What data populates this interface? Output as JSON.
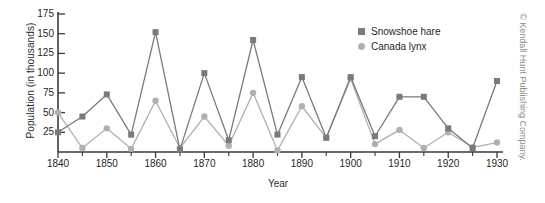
{
  "chart_data": {
    "type": "line",
    "title": "",
    "xlabel": "Year",
    "ylabel": "Population (in thousands)",
    "xlim": [
      1840,
      1930
    ],
    "ylim": [
      0,
      175
    ],
    "grid": false,
    "legend_position": "upper-right-inside",
    "x": [
      1840,
      1845,
      1850,
      1855,
      1860,
      1865,
      1870,
      1875,
      1880,
      1885,
      1890,
      1895,
      1900,
      1905,
      1910,
      1915,
      1920,
      1925,
      1930
    ],
    "xticks": [
      1840,
      1850,
      1860,
      1870,
      1880,
      1890,
      1900,
      1910,
      1920,
      1930
    ],
    "xtick_labels": [
      "1840",
      "1850",
      "1860",
      "1870",
      "1880",
      "1890",
      "1900",
      "1910",
      "1920",
      "1930"
    ],
    "xminor_ticks": [
      1845,
      1855,
      1865,
      1875,
      1885,
      1895,
      1905,
      1915,
      1925
    ],
    "yticks": [
      25,
      50,
      75,
      100,
      125,
      150,
      175
    ],
    "ytick_labels": [
      "25",
      "50",
      "75",
      "100",
      "125",
      "150",
      "175"
    ],
    "series": [
      {
        "name": "Snowshoe hare",
        "color": "#7a7a7a",
        "marker": "square",
        "values": [
          25,
          45,
          73,
          22,
          152,
          3,
          100,
          15,
          142,
          22,
          95,
          18,
          95,
          20,
          70,
          70,
          30,
          5,
          90
        ]
      },
      {
        "name": "Canada lynx",
        "color": "#b0b0b0",
        "marker": "circle",
        "values": [
          50,
          5,
          30,
          4,
          65,
          5,
          45,
          8,
          75,
          2,
          58,
          18,
          93,
          10,
          28,
          5,
          25,
          6,
          12
        ]
      }
    ]
  },
  "legend": {
    "items": [
      {
        "label": "Snowshoe hare",
        "marker": "square",
        "color": "#7a7a7a"
      },
      {
        "label": "Canada lynx",
        "marker": "circle",
        "color": "#b0b0b0"
      }
    ]
  },
  "credit": {
    "text": "© Kendall Hunt Publishing Company."
  },
  "colors": {
    "axis": "#3a3a3a",
    "hare": "#7a7a7a",
    "lynx": "#b0b0b0",
    "text": "#1f1f1f",
    "credit": "#8d8d8d"
  }
}
